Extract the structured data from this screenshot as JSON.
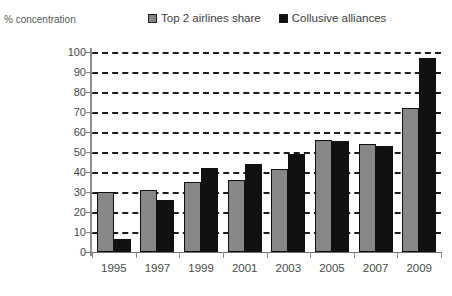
{
  "axis_caption": "% concentration",
  "legend": {
    "entries": [
      {
        "label": "Top 2 airlines share",
        "swatch": "grey-square-icon",
        "color": "#878787"
      },
      {
        "label": "Collusive alliances",
        "swatch": "black-square-icon",
        "color": "#111111"
      }
    ]
  },
  "chart_data": {
    "type": "bar",
    "title": "",
    "subtitle": "",
    "xlabel": "",
    "ylabel": "% concentration",
    "ylim": [
      0,
      100
    ],
    "ytick_step": 10,
    "yticks": [
      0,
      10,
      20,
      30,
      40,
      50,
      60,
      70,
      80,
      90,
      100
    ],
    "ytick_labels": [
      "0",
      "10",
      "20",
      "30",
      "40",
      "50",
      "60",
      "70",
      "80",
      "90",
      "100"
    ],
    "grid": "horizontal-dashed",
    "legend_position": "top",
    "categories": [
      "1995",
      "1997",
      "1999",
      "2001",
      "2003",
      "2005",
      "2007",
      "2009"
    ],
    "series": [
      {
        "name": "Top 2 airlines share",
        "color": "#878787",
        "values": [
          30,
          31,
          35,
          36,
          41.5,
          56,
          54,
          72
        ]
      },
      {
        "name": "Collusive alliances",
        "color": "#111111",
        "values": [
          6.5,
          26,
          42,
          44,
          49,
          55.5,
          53,
          97
        ]
      }
    ]
  }
}
